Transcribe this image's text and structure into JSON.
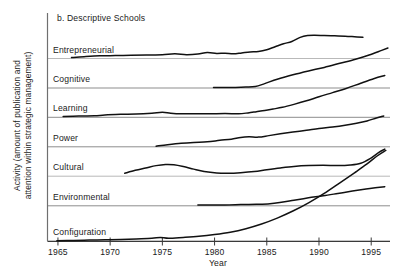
{
  "figure": {
    "title": "b. Descriptive Schools",
    "ylabel_line1": "Activity (amount of publication and",
    "ylabel_line2": "attention within strategic management)",
    "xlabel": "Year"
  },
  "chart_data": {
    "type": "line",
    "title": "b. Descriptive Schools",
    "xlabel": "Year",
    "ylabel": "Activity (amount of publication and attention within strategic management)",
    "xlim": [
      1964.0,
      1996.8
    ],
    "ylim": [
      0,
      7
    ],
    "grid": true,
    "grid_orientation": "horizontal-band-baselines",
    "legend": "none",
    "xticks": [
      1965,
      1970,
      1975,
      1980,
      1985,
      1990,
      1995
    ],
    "xtick_labels": [
      "1965",
      "1970",
      "1975",
      "1980",
      "1985",
      "1990",
      "1995"
    ],
    "yticks": [],
    "ytick_labels": [],
    "band_labels": [
      "Entrepreneurial",
      "Cognitive",
      "Learning",
      "Power",
      "Cultural",
      "Environmental",
      "Configuration"
    ],
    "note": "Each named school is drawn on its own baseline band; y is relative activity above that band baseline (band height = 1.0).",
    "series": [
      {
        "name": "Entrepreneurial",
        "band": 0,
        "x": [
          1966.3,
          1967.5,
          1969.0,
          1970.5,
          1972.0,
          1973.5,
          1975.0,
          1976.2,
          1977.3,
          1978.4,
          1979.3,
          1980.2,
          1981.0,
          1981.8,
          1982.6,
          1983.4,
          1984.2,
          1985.0,
          1985.8,
          1986.6,
          1987.4,
          1988.2,
          1988.9,
          1989.6,
          1990.5,
          1991.5,
          1992.5,
          1993.4,
          1994.2
        ],
        "values": [
          0.03,
          0.06,
          0.09,
          0.1,
          0.11,
          0.12,
          0.13,
          0.16,
          0.13,
          0.15,
          0.2,
          0.17,
          0.18,
          0.16,
          0.19,
          0.22,
          0.24,
          0.3,
          0.4,
          0.5,
          0.58,
          0.72,
          0.78,
          0.79,
          0.78,
          0.77,
          0.76,
          0.74,
          0.72
        ]
      },
      {
        "name": "Cognitive",
        "band": 1,
        "x": [
          1979.9,
          1981.0,
          1982.0,
          1983.0,
          1983.9,
          1984.8,
          1986.0,
          1987.5,
          1989.0,
          1990.5,
          1992.0,
          1993.5,
          1994.8,
          1996.0,
          1996.6
        ],
        "values": [
          0.02,
          0.02,
          0.02,
          0.03,
          0.05,
          0.15,
          0.3,
          0.45,
          0.58,
          0.7,
          0.84,
          0.98,
          1.12,
          1.28,
          1.36
        ]
      },
      {
        "name": "Learning",
        "band": 2,
        "x": [
          1965.5,
          1967.0,
          1968.5,
          1969.5,
          1971.0,
          1972.5,
          1974.0,
          1975.0,
          1975.8,
          1976.8,
          1978.0,
          1979.5,
          1981.0,
          1982.3,
          1983.2,
          1984.0,
          1984.8,
          1985.6,
          1986.5,
          1987.6,
          1988.8,
          1990.0,
          1991.3,
          1992.6,
          1994.0,
          1995.3,
          1996.3
        ],
        "values": [
          0.03,
          0.04,
          0.05,
          0.08,
          0.1,
          0.11,
          0.14,
          0.17,
          0.14,
          0.12,
          0.12,
          0.12,
          0.13,
          0.12,
          0.15,
          0.19,
          0.23,
          0.28,
          0.34,
          0.44,
          0.56,
          0.7,
          0.84,
          0.98,
          1.16,
          1.32,
          1.42
        ]
      },
      {
        "name": "Power",
        "band": 3,
        "x": [
          1974.4,
          1975.5,
          1976.8,
          1978.0,
          1979.3,
          1980.5,
          1981.6,
          1982.5,
          1983.3,
          1984.2,
          1985.2,
          1986.3,
          1987.5,
          1988.8,
          1990.0,
          1991.3,
          1992.5,
          1993.6,
          1994.6,
          1995.5,
          1996.2
        ],
        "values": [
          0.02,
          0.07,
          0.12,
          0.15,
          0.17,
          0.22,
          0.26,
          0.32,
          0.34,
          0.33,
          0.38,
          0.44,
          0.5,
          0.56,
          0.62,
          0.67,
          0.73,
          0.8,
          0.88,
          0.98,
          1.05
        ]
      },
      {
        "name": "Cultural",
        "band": 4,
        "x": [
          1971.4,
          1972.4,
          1973.4,
          1974.4,
          1975.3,
          1976.1,
          1977.0,
          1978.0,
          1979.0,
          1980.2,
          1981.3,
          1982.5,
          1983.8,
          1985.0,
          1986.3,
          1987.6,
          1989.0,
          1990.4,
          1991.8,
          1993.0,
          1994.0,
          1994.9,
          1995.7,
          1996.3
        ],
        "values": [
          0.1,
          0.2,
          0.28,
          0.36,
          0.4,
          0.39,
          0.33,
          0.24,
          0.16,
          0.11,
          0.1,
          0.12,
          0.16,
          0.22,
          0.28,
          0.33,
          0.36,
          0.37,
          0.36,
          0.38,
          0.44,
          0.6,
          0.8,
          0.92
        ]
      },
      {
        "name": "Environmental",
        "band": 5,
        "x": [
          1978.4,
          1979.5,
          1981.0,
          1982.5,
          1984.0,
          1985.3,
          1986.4,
          1987.6,
          1989.0,
          1990.4,
          1991.8,
          1993.2,
          1994.5,
          1995.6,
          1996.3
        ],
        "values": [
          0.03,
          0.03,
          0.03,
          0.04,
          0.05,
          0.07,
          0.12,
          0.19,
          0.27,
          0.34,
          0.42,
          0.5,
          0.57,
          0.62,
          0.65
        ]
      },
      {
        "name": "Configuration",
        "band": 6,
        "x": [
          1964.9,
          1966.5,
          1968.0,
          1969.5,
          1971.0,
          1972.5,
          1974.0,
          1974.8,
          1975.6,
          1977.0,
          1978.5,
          1980.0,
          1981.5,
          1983.0,
          1984.5,
          1986.0,
          1987.5,
          1989.0,
          1990.5,
          1992.0,
          1993.4,
          1994.6,
          1995.6,
          1996.4
        ],
        "values": [
          0.01,
          0.02,
          0.03,
          0.04,
          0.05,
          0.07,
          0.09,
          0.12,
          0.09,
          0.12,
          0.16,
          0.22,
          0.3,
          0.42,
          0.58,
          0.78,
          1.02,
          1.3,
          1.62,
          1.98,
          2.32,
          2.62,
          2.9,
          3.08
        ]
      }
    ]
  }
}
